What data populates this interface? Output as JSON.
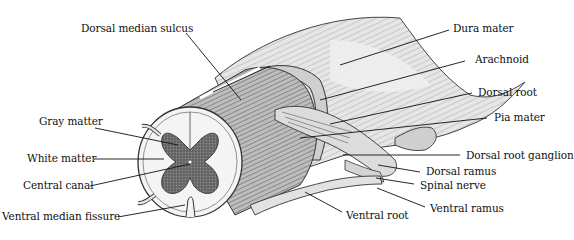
{
  "diagram": {
    "labels": {
      "dorsal_median_sulcus": "Dorsal median sulcus",
      "dura_mater": "Dura mater",
      "arachnoid": "Arachnoid",
      "dorsal_root": "Dorsal root",
      "pia_mater": "Pia mater",
      "gray_matter": "Gray matter",
      "white_matter": "White matter",
      "central_canal": "Central canal",
      "ventral_median_fissure": "Ventral median fissure",
      "dorsal_root_ganglion": "Dorsal root ganglion",
      "dorsal_ramus": "Dorsal ramus",
      "spinal_nerve": "Spinal nerve",
      "ventral_ramus": "Ventral ramus",
      "ventral_root": "Ventral root"
    },
    "colors": {
      "ink": "#111111",
      "gray_matter": "#6b6b6b",
      "white_matter": "#f4f4f4",
      "dura": "#d9d9d9",
      "shade": "#8a8a8a"
    }
  }
}
